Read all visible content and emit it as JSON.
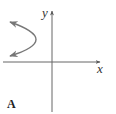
{
  "diagram": {
    "type": "graph-of-curve",
    "axes": {
      "x_label": "x",
      "y_label": "y",
      "color": "#666666"
    },
    "curve": {
      "shape": "parabola-opening-left",
      "color": "#777777",
      "vertex": [
        41,
        40
      ],
      "endpoints": [
        [
          9,
          22
        ],
        [
          9,
          56
        ]
      ],
      "arrows": "both-ends"
    },
    "panel_label": "A"
  }
}
